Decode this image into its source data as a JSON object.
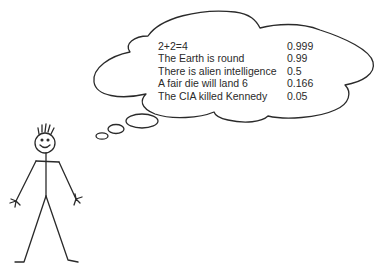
{
  "thought_bubble": {
    "beliefs": [
      {
        "statement": "2+2=4",
        "probability": "0.999"
      },
      {
        "statement": "The Earth is round",
        "probability": "0.99"
      },
      {
        "statement": "There is alien intelligence",
        "probability": "0.5"
      },
      {
        "statement": "A fair die will land 6",
        "probability": "0.166"
      },
      {
        "statement": "The CIA killed Kennedy",
        "probability": "0.05"
      }
    ]
  },
  "colors": {
    "line": "#2a2a2a",
    "background": "#ffffff"
  }
}
